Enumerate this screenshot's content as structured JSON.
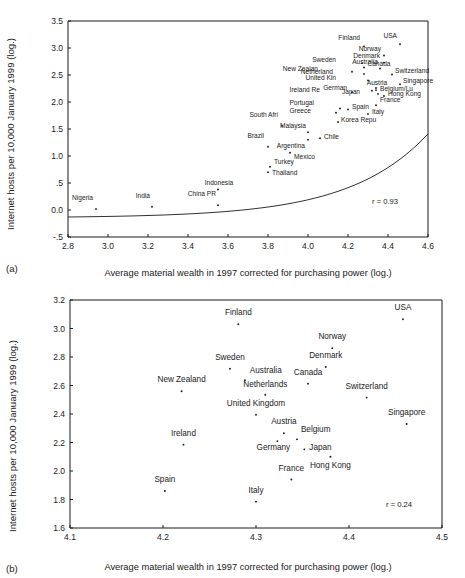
{
  "figure": {
    "caption_a": "(a)",
    "caption_b": "(b)"
  },
  "chart_data": [
    {
      "id": "panel-a",
      "type": "scatter",
      "title": "",
      "xlabel": "Average material wealth in 1997 corrected for purchasing power (log.)",
      "ylabel": "Internet hosts per 10,000 January 1999 (log.)",
      "xlim": [
        2.8,
        4.6
      ],
      "ylim": [
        -0.5,
        3.5
      ],
      "xticks": [
        "2.8",
        "3.0",
        "3.2",
        "3.4",
        "3.6",
        "3.8",
        "4.0",
        "4.2",
        "4.4",
        "4.6"
      ],
      "xtickvals": [
        2.8,
        3.0,
        3.2,
        3.4,
        3.6,
        3.8,
        4.0,
        4.2,
        4.4,
        4.6
      ],
      "yticks": [
        "3.5",
        "3.0",
        "2.5",
        "2.0",
        "1.5",
        "1.0",
        ".5",
        "0.0",
        "-.5"
      ],
      "ytickvals": [
        3.5,
        3.0,
        2.5,
        2.0,
        1.5,
        1.0,
        0.5,
        0.0,
        -0.5
      ],
      "grid": false,
      "legend": "none",
      "annotation": "r = 0.93",
      "fit_curve": "exponential trend through data",
      "points": [
        {
          "label": "Nigeria",
          "x": 2.94,
          "y": 0.02,
          "lx": -3,
          "ly": -9
        },
        {
          "label": "India",
          "x": 3.22,
          "y": 0.06,
          "lx": -2,
          "ly": -9
        },
        {
          "label": "Indonesia",
          "x": 3.55,
          "y": 0.38,
          "lx": 1,
          "ly": -4
        },
        {
          "label": "China PR",
          "x": 3.55,
          "y": 0.09,
          "lx": -2,
          "ly": -9
        },
        {
          "label": "Thailand",
          "x": 3.8,
          "y": 0.7,
          "lx": 4,
          "ly": 3
        },
        {
          "label": "Turkey",
          "x": 3.81,
          "y": 0.8,
          "lx": 4,
          "ly": -3
        },
        {
          "label": "Brazil",
          "x": 3.8,
          "y": 1.17,
          "lx": -4,
          "ly": -9
        },
        {
          "label": "Mexico",
          "x": 3.91,
          "y": 1.06,
          "lx": 4,
          "ly": 6
        },
        {
          "label": "Argentina",
          "x": 4.0,
          "y": 1.3,
          "lx": -3,
          "ly": 8
        },
        {
          "label": "Malaysia",
          "x": 4.0,
          "y": 1.44,
          "lx": -2,
          "ly": -4
        },
        {
          "label": "Chile",
          "x": 4.06,
          "y": 1.33,
          "lx": 4,
          "ly": 1
        },
        {
          "label": "South Afri",
          "x": 3.87,
          "y": 1.56,
          "lx": -4,
          "ly": -9
        },
        {
          "label": "Korea Repu",
          "x": 4.15,
          "y": 1.63,
          "lx": 3,
          "ly": 0
        },
        {
          "label": "Greece",
          "x": 4.14,
          "y": 1.8,
          "lx": -25,
          "ly": 0
        },
        {
          "label": "Portugal",
          "x": 4.16,
          "y": 1.88,
          "lx": -26,
          "ly": -3
        },
        {
          "label": "Italy",
          "x": 4.3,
          "y": 1.78,
          "lx": 4,
          "ly": 0
        },
        {
          "label": "Spain",
          "x": 4.2,
          "y": 1.86,
          "lx": 4,
          "ly": -1
        },
        {
          "label": "France",
          "x": 4.34,
          "y": 1.94,
          "lx": 4,
          "ly": -3
        },
        {
          "label": "Hong Kong",
          "x": 4.38,
          "y": 2.11,
          "lx": 4,
          "ly": 0
        },
        {
          "label": "Japan",
          "x": 4.35,
          "y": 2.15,
          "lx": -18,
          "ly": 0
        },
        {
          "label": "Belgium/Lu",
          "x": 4.34,
          "y": 2.22,
          "lx": 4,
          "ly": 1
        },
        {
          "label": "Ireland Re",
          "x": 4.22,
          "y": 2.18,
          "lx": -32,
          "ly": 0
        },
        {
          "label": "German",
          "x": 4.32,
          "y": 2.21,
          "lx": -25,
          "ly": -1
        },
        {
          "label": "Austria",
          "x": 4.34,
          "y": 2.26,
          "lx": 1,
          "ly": -3
        },
        {
          "label": "Singapore",
          "x": 4.46,
          "y": 2.33,
          "lx": 3,
          "ly": -1
        },
        {
          "label": "United Kin",
          "x": 4.3,
          "y": 2.4,
          "lx": -32,
          "ly": 0
        },
        {
          "label": "Switzerland",
          "x": 4.42,
          "y": 2.51,
          "lx": 3,
          "ly": -1
        },
        {
          "label": "Netherland",
          "x": 4.28,
          "y": 2.52,
          "lx": -31,
          "ly": 0
        },
        {
          "label": "New Zealan",
          "x": 4.22,
          "y": 2.56,
          "lx": -34,
          "ly": -1
        },
        {
          "label": "Canada",
          "x": 4.36,
          "y": 2.62,
          "lx": -1,
          "ly": -3
        },
        {
          "label": "Australia",
          "x": 4.28,
          "y": 2.64,
          "lx": 1,
          "ly": -3
        },
        {
          "label": "Sweden",
          "x": 4.27,
          "y": 2.72,
          "lx": -26,
          "ly": -1
        },
        {
          "label": "Denmark",
          "x": 4.38,
          "y": 2.73,
          "lx": -4,
          "ly": -5
        },
        {
          "label": "Norway",
          "x": 4.38,
          "y": 2.86,
          "lx": -3,
          "ly": -5
        },
        {
          "label": "Finland",
          "x": 4.28,
          "y": 3.03,
          "lx": -4,
          "ly": -6
        },
        {
          "label": "USA",
          "x": 4.46,
          "y": 3.07,
          "lx": -3,
          "ly": -6
        }
      ]
    },
    {
      "id": "panel-b",
      "type": "scatter",
      "title": "",
      "xlabel": "Average material wealth in 1997 corrected for purchasing power (log.)",
      "ylabel": "Internet hosts per 10,000 January 1999 (log.)",
      "xlim": [
        4.1,
        4.5
      ],
      "ylim": [
        1.6,
        3.2
      ],
      "xticks": [
        "4.1",
        "4.2",
        "4.3",
        "4.4",
        "4.5"
      ],
      "xtickvals": [
        4.1,
        4.2,
        4.3,
        4.4,
        4.5
      ],
      "yticks": [
        "3.2",
        "3.0",
        "2.8",
        "2.6",
        "2.4",
        "2.2",
        "2.0",
        "1.8",
        "1.6"
      ],
      "ytickvals": [
        3.2,
        3.0,
        2.8,
        2.6,
        2.4,
        2.2,
        2.0,
        1.8,
        1.6
      ],
      "grid": false,
      "legend": "none",
      "annotation": "r = 0.24",
      "points": [
        {
          "label": "USA",
          "x": 4.458,
          "y": 3.065,
          "lx": 0,
          "ly": -9,
          "anchor": "middle"
        },
        {
          "label": "Finland",
          "x": 4.281,
          "y": 3.03,
          "lx": 0,
          "ly": -9,
          "anchor": "middle"
        },
        {
          "label": "Norway",
          "x": 4.382,
          "y": 2.862,
          "lx": 0,
          "ly": -9,
          "anchor": "middle"
        },
        {
          "label": "Denmark",
          "x": 4.375,
          "y": 2.73,
          "lx": 0,
          "ly": -9,
          "anchor": "middle"
        },
        {
          "label": "Sweden",
          "x": 4.272,
          "y": 2.718,
          "lx": 0,
          "ly": -9,
          "anchor": "middle"
        },
        {
          "label": "Australia",
          "x": 4.288,
          "y": 2.637,
          "lx": 5,
          "ly": -7,
          "anchor": "start"
        },
        {
          "label": "Canada",
          "x": 4.356,
          "y": 2.612,
          "lx": 0,
          "ly": -9,
          "anchor": "middle"
        },
        {
          "label": "New Zealand",
          "x": 4.22,
          "y": 2.56,
          "lx": 0,
          "ly": -9,
          "anchor": "middle"
        },
        {
          "label": "Netherlands",
          "x": 4.31,
          "y": 2.535,
          "lx": 0,
          "ly": -8,
          "anchor": "middle"
        },
        {
          "label": "Switzerland",
          "x": 4.419,
          "y": 2.515,
          "lx": 0,
          "ly": -9,
          "anchor": "middle"
        },
        {
          "label": "United Kingdom",
          "x": 4.3,
          "y": 2.395,
          "lx": 0,
          "ly": -9,
          "anchor": "middle"
        },
        {
          "label": "Singapore",
          "x": 4.462,
          "y": 2.33,
          "lx": 0,
          "ly": -9,
          "anchor": "middle"
        },
        {
          "label": "Belgium",
          "x": 4.344,
          "y": 2.222,
          "lx": 4,
          "ly": -7,
          "anchor": "start"
        },
        {
          "label": "Austria",
          "x": 4.33,
          "y": 2.265,
          "lx": 0,
          "ly": -9,
          "anchor": "middle"
        },
        {
          "label": "Germany",
          "x": 4.323,
          "y": 2.21,
          "lx": -4,
          "ly": 9,
          "anchor": "middle"
        },
        {
          "label": "Ireland",
          "x": 4.222,
          "y": 2.185,
          "lx": 0,
          "ly": -9,
          "anchor": "middle"
        },
        {
          "label": "Japan",
          "x": 4.352,
          "y": 2.152,
          "lx": 5,
          "ly": 1,
          "anchor": "start"
        },
        {
          "label": "Hong Kong",
          "x": 4.38,
          "y": 2.1,
          "lx": 0,
          "ly": 11,
          "anchor": "middle"
        },
        {
          "label": "France",
          "x": 4.338,
          "y": 1.94,
          "lx": 0,
          "ly": -9,
          "anchor": "middle"
        },
        {
          "label": "Spain",
          "x": 4.202,
          "y": 1.86,
          "lx": 0,
          "ly": -9,
          "anchor": "middle"
        },
        {
          "label": "Italy",
          "x": 4.3,
          "y": 1.785,
          "lx": 0,
          "ly": -9,
          "anchor": "middle"
        }
      ]
    }
  ]
}
